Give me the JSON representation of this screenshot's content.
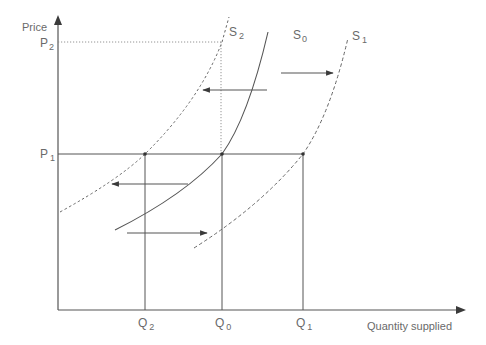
{
  "diagram": {
    "title": "",
    "colors": {
      "axis": "#555555",
      "line": "#5a5a5a",
      "text": "#6a6a6a",
      "dot": "#333333"
    },
    "axes": {
      "y_label": "Price",
      "x_label": "Quantity supplied"
    },
    "price_levels": [
      {
        "id": "P2",
        "main": "P",
        "sub": "2"
      },
      {
        "id": "P1",
        "main": "P",
        "sub": "1"
      }
    ],
    "quantity_levels": [
      {
        "id": "Q2",
        "main": "Q",
        "sub": "2"
      },
      {
        "id": "Q0",
        "main": "Q",
        "sub": "0"
      },
      {
        "id": "Q1",
        "main": "Q",
        "sub": "1"
      }
    ],
    "curves": [
      {
        "id": "S0",
        "main": "S",
        "sub": "0",
        "style": "solid",
        "description": "original supply curve"
      },
      {
        "id": "S1",
        "main": "S",
        "sub": "1",
        "style": "dashed",
        "description": "supply shifted right"
      },
      {
        "id": "S2",
        "main": "S",
        "sub": "2",
        "style": "dotted",
        "description": "supply shifted left"
      }
    ],
    "arrows": [
      {
        "from": "S0",
        "to": "S2",
        "direction": "left",
        "position": "upper"
      },
      {
        "from": "S0",
        "to": "S1",
        "direction": "right",
        "position": "upper"
      },
      {
        "from": "S0",
        "to": "S2",
        "direction": "left",
        "position": "lower"
      },
      {
        "from": "S0",
        "to": "S1",
        "direction": "right",
        "position": "lower"
      }
    ],
    "points": [
      {
        "at": "P1-Q2",
        "curve": "S2"
      },
      {
        "at": "P1-Q0",
        "curve": "S0"
      },
      {
        "at": "P1-Q1",
        "curve": "S1"
      }
    ]
  }
}
